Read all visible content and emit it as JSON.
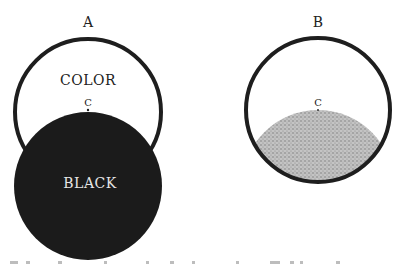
{
  "figure": {
    "diagram_a": {
      "label": "A",
      "top_region_label": "COLOR",
      "point_label": "C",
      "bottom_region_label": "BLACK",
      "outline_color": "#1e1e1e",
      "black_fill": "#1b1b1b"
    },
    "diagram_b": {
      "label": "B",
      "point_label": "C",
      "outline_color": "#1e1e1e",
      "stipple_fill": "#b3b3b3"
    },
    "caption": {
      "note": ""
    }
  }
}
